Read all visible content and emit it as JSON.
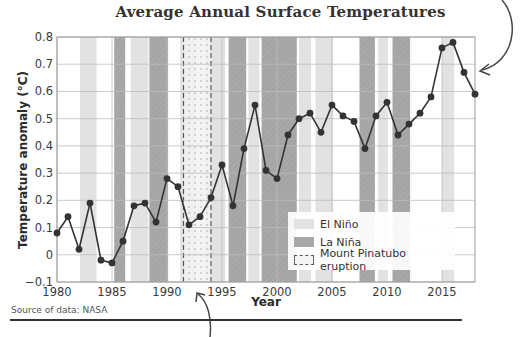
{
  "title": "Average Annual Surface Temperatures",
  "source": "Source of data: NASA",
  "legend": {
    "items": [
      {
        "label": "El Niño",
        "type": "elnino"
      },
      {
        "label": "La Niña",
        "type": "lanina"
      },
      {
        "label": "Mount Pinatubo eruption",
        "type": "pinatubo"
      }
    ]
  },
  "colors": {
    "elnino": "#e2e2e2",
    "lanina": "#a8a8a8",
    "pinatubo_border": "#555555",
    "line": "#333333",
    "grid": "#bdbdbd"
  },
  "chart_data": {
    "type": "line",
    "title": "Average Annual Surface Temperatures",
    "xlabel": "Year",
    "ylabel": "Temperature anomaly (°C)",
    "xlim": [
      1980,
      2018
    ],
    "ylim": [
      -0.1,
      0.8
    ],
    "xticks": [
      1980,
      1985,
      1990,
      1995,
      2000,
      2005,
      2010,
      2015
    ],
    "yticks": [
      -0.1,
      0,
      0.1,
      0.2,
      0.3,
      0.4,
      0.5,
      0.6,
      0.7,
      0.8
    ],
    "ytick_labels": [
      "−0.1",
      "0",
      "0.1",
      "0.2",
      "0.3",
      "0.4",
      "0.5",
      "0.6",
      "0.7",
      "0.8"
    ],
    "grid": true,
    "legend_position": "lower right",
    "x": [
      1980,
      1981,
      1982,
      1983,
      1984,
      1985,
      1986,
      1987,
      1988,
      1989,
      1990,
      1991,
      1992,
      1993,
      1994,
      1995,
      1996,
      1997,
      1998,
      1999,
      2000,
      2001,
      2002,
      2003,
      2004,
      2005,
      2006,
      2007,
      2008,
      2009,
      2010,
      2011,
      2012,
      2013,
      2014,
      2015,
      2016,
      2017,
      2018
    ],
    "series": [
      {
        "name": "Temperature anomaly",
        "values": [
          0.08,
          0.14,
          0.02,
          0.19,
          -0.02,
          -0.03,
          0.05,
          0.18,
          0.19,
          0.12,
          0.28,
          0.25,
          0.11,
          0.14,
          0.21,
          0.33,
          0.18,
          0.39,
          0.55,
          0.31,
          0.28,
          0.44,
          0.5,
          0.52,
          0.45,
          0.55,
          0.51,
          0.49,
          0.39,
          0.51,
          0.56,
          0.44,
          0.48,
          0.52,
          0.58,
          0.76,
          0.78,
          0.67,
          0.59
        ]
      }
    ],
    "bands": [
      {
        "type": "elnino",
        "start": 1982.1,
        "end": 1983.6
      },
      {
        "type": "lanina",
        "start": 1985.2,
        "end": 1986.2
      },
      {
        "type": "elnino",
        "start": 1986.7,
        "end": 1988.3
      },
      {
        "type": "lanina",
        "start": 1988.4,
        "end": 1990.1
      },
      {
        "type": "elnino",
        "start": 1991.2,
        "end": 1992.6
      },
      {
        "type": "elnino",
        "start": 1993.6,
        "end": 1994.0
      },
      {
        "type": "elnino",
        "start": 1994.0,
        "end": 1995.3
      },
      {
        "type": "lanina",
        "start": 1995.6,
        "end": 1997.2
      },
      {
        "type": "elnino",
        "start": 1997.4,
        "end": 1998.4
      },
      {
        "type": "lanina",
        "start": 1998.6,
        "end": 2001.8
      },
      {
        "type": "elnino",
        "start": 2002.0,
        "end": 2003.1
      },
      {
        "type": "elnino",
        "start": 2003.5,
        "end": 2005.1
      },
      {
        "type": "lanina",
        "start": 2007.5,
        "end": 2008.9
      },
      {
        "type": "elnino",
        "start": 2009.2,
        "end": 2009.9
      },
      {
        "type": "lanina",
        "start": 2010.5,
        "end": 2012.1
      },
      {
        "type": "elnino",
        "start": 2015.0,
        "end": 2016.1
      }
    ],
    "pinatubo": {
      "start": 1991.5,
      "end": 1994.0
    }
  }
}
